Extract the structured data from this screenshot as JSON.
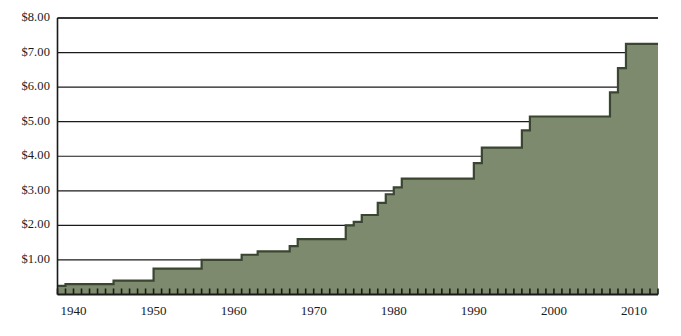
{
  "chart_data": {
    "type": "area",
    "title": "",
    "subtitle": "",
    "xlabel": "",
    "ylabel": "",
    "grid": true,
    "legend": false,
    "legend_position": "none",
    "xlim": [
      1938,
      2013
    ],
    "ylim": [
      0,
      8
    ],
    "ytick_labels": [
      "$1.00",
      "$2.00",
      "$3.00",
      "$4.00",
      "$5.00",
      "$6.00",
      "$7.00",
      "$8.00"
    ],
    "ytick_values": [
      1,
      2,
      3,
      4,
      5,
      6,
      7,
      8
    ],
    "xtick_labels": [
      "1940",
      "1950",
      "1960",
      "1970",
      "1980",
      "1990",
      "2000",
      "2010"
    ],
    "xtick_values": [
      1940,
      1950,
      1960,
      1970,
      1980,
      1990,
      2000,
      2010
    ],
    "minor_xticks_every": 1,
    "series": [
      {
        "name": "Federal minimum wage",
        "x": [
          1938,
          1939,
          1940,
          1941,
          1942,
          1943,
          1944,
          1945,
          1946,
          1947,
          1948,
          1949,
          1950,
          1951,
          1952,
          1953,
          1954,
          1955,
          1956,
          1957,
          1958,
          1959,
          1960,
          1961,
          1962,
          1963,
          1964,
          1965,
          1966,
          1967,
          1968,
          1969,
          1970,
          1971,
          1972,
          1973,
          1974,
          1975,
          1976,
          1977,
          1978,
          1979,
          1980,
          1981,
          1982,
          1983,
          1984,
          1985,
          1986,
          1987,
          1988,
          1989,
          1990,
          1991,
          1992,
          1993,
          1994,
          1995,
          1996,
          1997,
          1998,
          1999,
          2000,
          2001,
          2002,
          2003,
          2004,
          2005,
          2006,
          2007,
          2008,
          2009,
          2010,
          2011,
          2012
        ],
        "values": [
          0.25,
          0.3,
          0.3,
          0.3,
          0.3,
          0.3,
          0.3,
          0.4,
          0.4,
          0.4,
          0.4,
          0.4,
          0.75,
          0.75,
          0.75,
          0.75,
          0.75,
          0.75,
          1.0,
          1.0,
          1.0,
          1.0,
          1.0,
          1.15,
          1.15,
          1.25,
          1.25,
          1.25,
          1.25,
          1.4,
          1.6,
          1.6,
          1.6,
          1.6,
          1.6,
          1.6,
          2.0,
          2.1,
          2.3,
          2.3,
          2.65,
          2.9,
          3.1,
          3.35,
          3.35,
          3.35,
          3.35,
          3.35,
          3.35,
          3.35,
          3.35,
          3.35,
          3.8,
          4.25,
          4.25,
          4.25,
          4.25,
          4.25,
          4.75,
          5.15,
          5.15,
          5.15,
          5.15,
          5.15,
          5.15,
          5.15,
          5.15,
          5.15,
          5.15,
          5.85,
          6.55,
          7.25,
          7.25,
          7.25,
          7.25
        ]
      }
    ]
  },
  "colors": {
    "fill": "#7d8a6d",
    "stroke": "#3a4630",
    "axis": "#1a1a1a",
    "gridline": "#1a1a1a",
    "background": "#ffffff",
    "label": "#1a1a1a"
  }
}
